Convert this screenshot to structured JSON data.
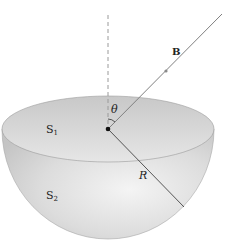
{
  "figure": {
    "labels": {
      "field": "B",
      "angle": "θ",
      "radius": "R",
      "surface1_main": "S",
      "surface1_sub": "1",
      "surface2_main": "S",
      "surface2_sub": "2"
    },
    "colors": {
      "surface_light": "#f2f2f2",
      "surface_mid": "#d9d9d9",
      "surface_dark": "#bdbdbd",
      "line": "#555555",
      "field_line": "#808080",
      "dashed": "#9a9a9a"
    }
  }
}
